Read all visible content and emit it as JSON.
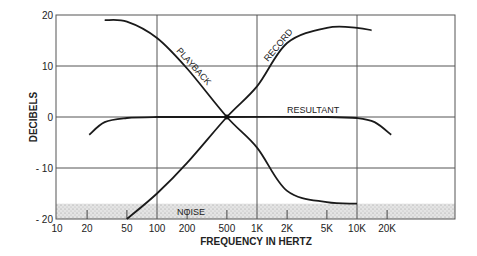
{
  "chart_data": {
    "type": "line",
    "title": "",
    "xlabel": "FREQUENCY IN HERTZ",
    "ylabel": "DECIBELS",
    "xscale": "log",
    "xlim": [
      10,
      40000
    ],
    "ylim": [
      -20,
      20
    ],
    "grid": true,
    "x_ticks": [
      "10",
      "20",
      "50",
      "100",
      "200",
      "500",
      "1K",
      "2K",
      "5K",
      "10K",
      "20K"
    ],
    "y_ticks": [
      "20",
      "10",
      "0",
      "- 10",
      "- 20"
    ],
    "series": [
      {
        "name": "PLAYBACK",
        "x": [
          30,
          50,
          100,
          200,
          500,
          1000,
          2000,
          5000,
          10000
        ],
        "y": [
          19,
          18.7,
          15.5,
          9.5,
          0,
          -6,
          -14.5,
          -16.7,
          -17
        ]
      },
      {
        "name": "RECORD",
        "x": [
          50,
          100,
          200,
          500,
          1000,
          2000,
          5000,
          10000,
          14000
        ],
        "y": [
          -20,
          -15,
          -9,
          0,
          6,
          14.5,
          17.5,
          17.5,
          17
        ]
      },
      {
        "name": "RESULTANT",
        "x": [
          21,
          30,
          50,
          100,
          500,
          5000,
          10000,
          15000,
          22000
        ],
        "y": [
          -3.5,
          -1,
          -0.2,
          0,
          0,
          0,
          -0.2,
          -1,
          -3.5
        ]
      }
    ],
    "annotations": [
      {
        "text": "PLAYBACK"
      },
      {
        "text": "RECORD"
      },
      {
        "text": "RESULTANT"
      },
      {
        "text": "NOISE"
      }
    ],
    "noise_band": {
      "from": -20,
      "to": -17
    }
  },
  "labels": {
    "xlabel": "FREQUENCY IN HERTZ",
    "ylabel": "DECIBELS",
    "playback": "PLAYBACK",
    "record": "RECORD",
    "resultant": "RESULTANT",
    "noise": "NOISE"
  }
}
